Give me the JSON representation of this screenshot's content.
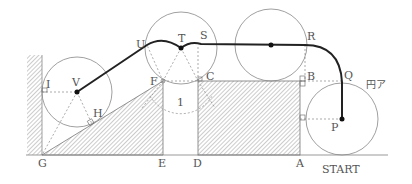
{
  "diagram": {
    "type": "geometry-figure",
    "points": {
      "A": "A",
      "B": "B",
      "C": "C",
      "D": "D",
      "E": "E",
      "F": "F",
      "G": "G",
      "H": "H",
      "I": "I",
      "P": "P",
      "Q": "Q",
      "R": "R",
      "S": "S",
      "T": "T",
      "U": "U",
      "V": "V"
    },
    "gap_label": "1",
    "circle_label": "円ア",
    "start_label": "START",
    "colors": {
      "path": "#222222",
      "thin": "#888888",
      "hatch": "#999999"
    }
  }
}
